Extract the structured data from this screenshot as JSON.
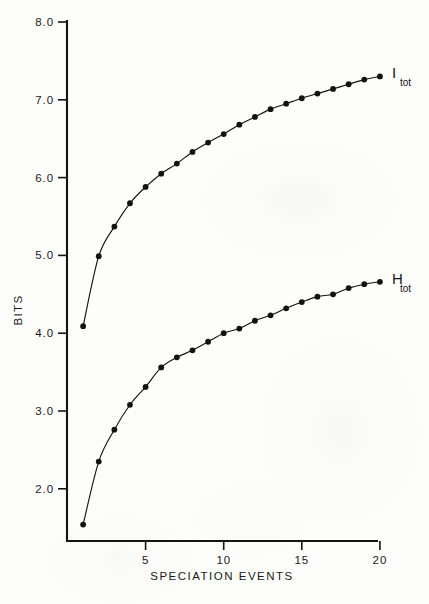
{
  "chart_data": {
    "type": "line",
    "title": "",
    "xlabel": "SPECIATION   EVENTS",
    "ylabel": "BITS",
    "xlim": [
      0.2,
      21
    ],
    "ylim": [
      1.0,
      8.0
    ],
    "grid": false,
    "legend_position": "right-of-curve-end",
    "xticks": [
      5,
      10,
      15,
      20
    ],
    "xtick_labels": [
      "5",
      "10",
      "15",
      "20"
    ],
    "yticks": [
      2.0,
      3.0,
      4.0,
      5.0,
      6.0,
      7.0,
      8.0
    ],
    "ytick_labels": [
      "2.0",
      "3.0",
      "4.0",
      "5.0",
      "6.0",
      "7.0",
      "8.0"
    ],
    "x": [
      1,
      2,
      3,
      4,
      5,
      6,
      7,
      8,
      9,
      10,
      11,
      12,
      13,
      14,
      15,
      16,
      17,
      18,
      19,
      20
    ],
    "series": [
      {
        "name": "I_tot",
        "label_main": "I",
        "label_sub": "tot",
        "values": [
          4.09,
          4.99,
          5.37,
          5.67,
          5.88,
          6.05,
          6.18,
          6.33,
          6.45,
          6.56,
          6.68,
          6.78,
          6.88,
          6.95,
          7.02,
          7.08,
          7.14,
          7.2,
          7.26,
          7.3
        ]
      },
      {
        "name": "H_tot",
        "label_main": "H",
        "label_sub": "tot",
        "values": [
          1.54,
          2.35,
          2.76,
          3.08,
          3.31,
          3.56,
          3.69,
          3.78,
          3.89,
          4.0,
          4.06,
          4.16,
          4.23,
          4.32,
          4.4,
          4.47,
          4.5,
          4.58,
          4.63,
          4.66
        ]
      }
    ]
  },
  "axes": {
    "y_axis_name": "BITS",
    "x_axis_name": "SPECIATION   EVENTS"
  }
}
